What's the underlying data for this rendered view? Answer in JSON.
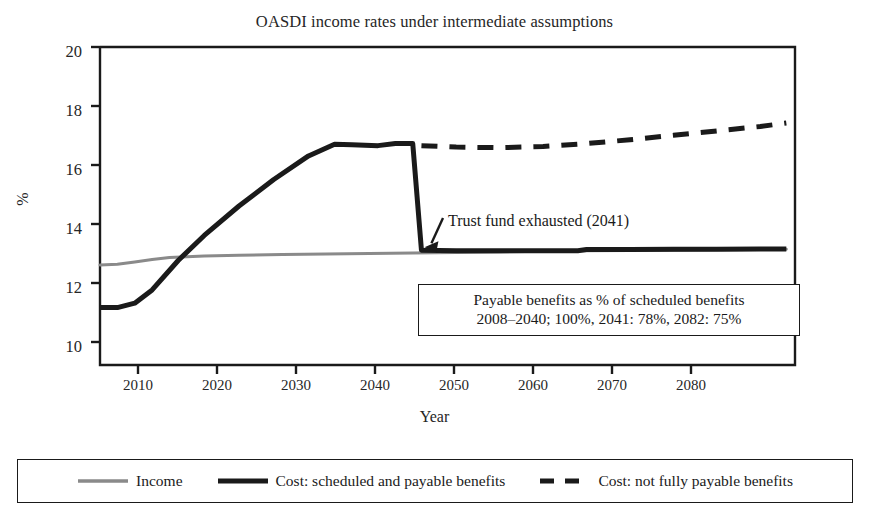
{
  "chart_data": {
    "type": "line",
    "title": "OASDI income rates under intermediate assumptions",
    "xlabel": "Year",
    "ylabel": "%",
    "xlim": [
      2004,
      2084
    ],
    "ylim": [
      9.2,
      20
    ],
    "xticks": [
      2010,
      2020,
      2030,
      2040,
      2050,
      2060,
      2070,
      2080
    ],
    "xtick_labels": [
      "2010",
      "2020",
      "2030",
      "2040",
      "2050",
      "2060",
      "2070",
      "2080"
    ],
    "yticks": [
      10,
      12,
      14,
      16,
      18,
      20
    ],
    "ytick_labels": [
      "10",
      "12",
      "14",
      "16",
      "18",
      "20"
    ],
    "grid": false,
    "legend_position": "below-figure",
    "series": [
      {
        "name": "Income",
        "style": "solid",
        "color": "#8a8a8a",
        "width": 3,
        "x": [
          2004,
          2006,
          2008,
          2010,
          2012,
          2014,
          2016,
          2020,
          2025,
          2030,
          2035,
          2040,
          2045,
          2050,
          2055,
          2060,
          2065,
          2070,
          2075,
          2080,
          2083
        ],
        "y": [
          12.6,
          12.62,
          12.7,
          12.78,
          12.85,
          12.88,
          12.9,
          12.93,
          12.95,
          12.97,
          12.99,
          13.0,
          13.02,
          13.04,
          13.06,
          13.08,
          13.09,
          13.1,
          13.11,
          13.12,
          13.13
        ]
      },
      {
        "name": "Cost: scheduled and payable benefits",
        "style": "solid",
        "color": "#1a1a1a",
        "width": 5,
        "x": [
          2004,
          2006,
          2008,
          2010,
          2013,
          2016,
          2020,
          2024,
          2028,
          2031,
          2033,
          2036,
          2038,
          2040,
          2041,
          2045,
          2050,
          2055,
          2059,
          2060,
          2065,
          2070,
          2075,
          2080,
          2083
        ],
        "y": [
          11.15,
          11.15,
          11.3,
          11.75,
          12.75,
          13.6,
          14.6,
          15.5,
          16.3,
          16.7,
          16.68,
          16.65,
          16.72,
          16.72,
          13.1,
          13.08,
          13.08,
          13.08,
          13.08,
          13.12,
          13.12,
          13.13,
          13.13,
          13.14,
          13.14
        ]
      },
      {
        "name": "Cost: not fully payable benefits",
        "style": "dashed",
        "color": "#1a1a1a",
        "width": 5,
        "x": [
          2041,
          2045,
          2050,
          2055,
          2060,
          2065,
          2070,
          2075,
          2080,
          2083
        ],
        "y": [
          16.65,
          16.6,
          16.58,
          16.62,
          16.72,
          16.85,
          17.0,
          17.15,
          17.3,
          17.42
        ]
      }
    ],
    "annotations": [
      {
        "name": "trust-fund-exhausted",
        "text": "Trust fund exhausted (2041)",
        "arrow_to_x": 2041,
        "arrow_to_y": 13.3
      }
    ],
    "note_box": {
      "line1": "Payable benefits as % of scheduled benefits",
      "line2": "2008–2040; 100%, 2041: 78%, 2082: 75%"
    }
  }
}
